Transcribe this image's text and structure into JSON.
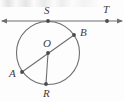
{
  "figure": {
    "stroke_color": "#6e6e73",
    "label_color": "#3e3e42",
    "background_color": "#fdfdfd"
  },
  "circle": {
    "name": "circle-O",
    "center_x": 48,
    "center_y": 53,
    "radius": 31.5
  },
  "tangent_line": {
    "name": "tangent-line-ST",
    "y": 21,
    "x_start": 2,
    "x_end": 122,
    "arrow_left": true,
    "arrow_right": true
  },
  "segments": [
    {
      "name": "diameter-AB",
      "from": "A",
      "to": "B",
      "x1": 22,
      "y1": 72,
      "x2": 74,
      "y2": 35
    },
    {
      "name": "radius-OR",
      "from": "O",
      "to": "R",
      "x1": 48,
      "y1": 53,
      "x2": 46,
      "y2": 84
    }
  ],
  "points": [
    {
      "id": "S",
      "label": "S",
      "x": 48,
      "y": 21,
      "label_x": 44,
      "label_y": 5,
      "marked": true
    },
    {
      "id": "T",
      "label": "T",
      "x": 107,
      "y": 21,
      "label_x": 103,
      "label_y": 4,
      "marked": true
    },
    {
      "id": "O",
      "label": "O",
      "x": 48,
      "y": 53,
      "label_x": 43,
      "label_y": 38,
      "marked": true
    },
    {
      "id": "B",
      "label": "B",
      "x": 74,
      "y": 35,
      "label_x": 80,
      "label_y": 27,
      "marked": true
    },
    {
      "id": "A",
      "label": "A",
      "x": 22,
      "y": 72,
      "label_x": 9,
      "label_y": 68,
      "marked": true
    },
    {
      "id": "R",
      "label": "R",
      "x": 46,
      "y": 84,
      "label_x": 43,
      "label_y": 88,
      "marked": true
    }
  ]
}
